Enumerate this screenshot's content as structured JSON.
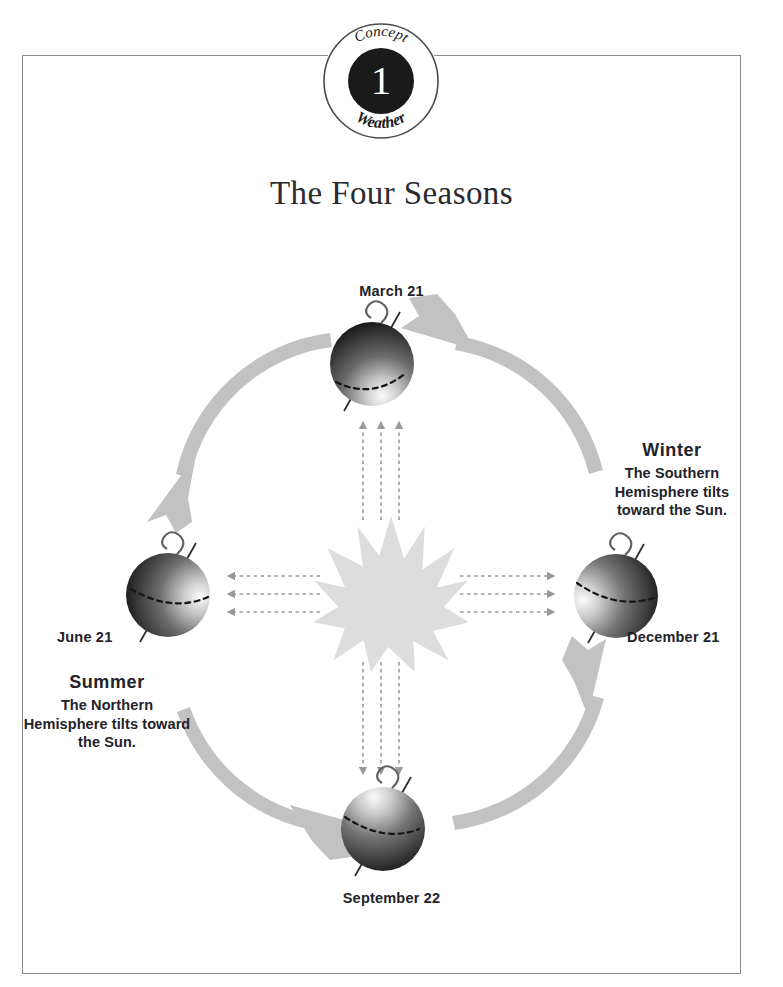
{
  "badge": {
    "top_text": "Concept",
    "number": "1",
    "bottom_text": "Weather"
  },
  "title": "The Four Seasons",
  "diagram": {
    "type": "orbital-seasons-diagram",
    "center_object": "sun-starburst",
    "orbit_direction": "counter-clockwise",
    "positions": [
      {
        "id": "march",
        "label": "March 21",
        "angle_deg": 90,
        "season": ""
      },
      {
        "id": "june",
        "label": "June 21",
        "angle_deg": 180,
        "season": "Summer"
      },
      {
        "id": "september",
        "label": "September 22",
        "angle_deg": 270,
        "season": ""
      },
      {
        "id": "december",
        "label": "December 21",
        "angle_deg": 0,
        "season": "Winter"
      }
    ],
    "annotations": [
      {
        "id": "winter",
        "title": "Winter",
        "body": "The Southern Hemisphere tilts toward the Sun."
      },
      {
        "id": "summer",
        "title": "Summer",
        "body": "The Northern Hemisphere tilts toward the Sun."
      }
    ],
    "sunray_groups": 4,
    "sunrays_per_group": 3
  },
  "colors": {
    "orbit_arrow": "#c2c2c2",
    "sun": "#dcdcdc",
    "ray": "#9a9a9a",
    "earth_dark": "#1c1c1c",
    "earth_light": "#f2f2f2",
    "frame": "#8a8a8e",
    "text": "#22222a",
    "badge_fill": "#1a1a1a"
  }
}
